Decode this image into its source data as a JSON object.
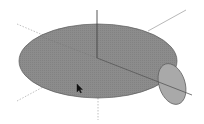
{
  "viewport": {
    "background": "#ffffff",
    "disc": {
      "cx": 98,
      "cy": 61,
      "rx": 79,
      "ry": 37,
      "fill": "#8c8c8c",
      "stroke": "#5a5a5a"
    },
    "small_disc": {
      "cx": 172,
      "cy": 84,
      "rx": 13,
      "ry": 21,
      "rotate": -18,
      "fill": "#a9a9a9",
      "stroke": "#5a5a5a"
    },
    "axis_color_solid": "#555555",
    "axis_color_light": "#b5b5b5",
    "cursor": {
      "x": 77,
      "y": 86,
      "icon": "arrow-cursor-icon"
    }
  }
}
